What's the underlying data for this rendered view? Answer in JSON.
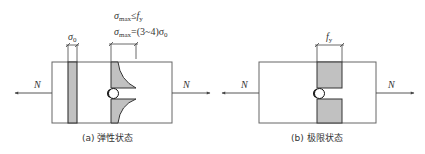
{
  "figure": {
    "panel_a": {
      "caption": "(a) 弹性状态",
      "force_left": "N",
      "force_right": "N",
      "sigma0_label": "σ",
      "sigma0_sub": "0",
      "eq1_sigma": "σ",
      "eq1_sub": "max",
      "eq1_rel": "≤",
      "eq1_f": "f",
      "eq1_fsub": "y",
      "eq2_sigma": "σ",
      "eq2_sub": "max",
      "eq2_rest": "=(3~4)σ",
      "eq2_rsub": "0"
    },
    "panel_b": {
      "caption": "(b) 极限状态",
      "force_left": "N",
      "force_right": "N",
      "fy_label": "f",
      "fy_sub": "y"
    }
  },
  "colors": {
    "line": "#555555",
    "hatch": "#888888",
    "fill": "#d8d8d8"
  }
}
